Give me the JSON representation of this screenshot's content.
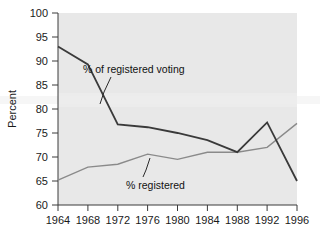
{
  "chart_data": {
    "type": "line",
    "title": "",
    "xlabel": "",
    "ylabel": "Percent",
    "x": [
      1964,
      1968,
      1972,
      1976,
      1980,
      1984,
      1988,
      1992,
      1996
    ],
    "xlim": [
      1964,
      1996
    ],
    "ylim": [
      60,
      100
    ],
    "xticks": [
      1964,
      1968,
      1972,
      1976,
      1980,
      1984,
      1988,
      1992,
      1996
    ],
    "yticks": [
      60,
      65,
      70,
      75,
      80,
      85,
      90,
      95,
      100
    ],
    "grid": false,
    "legend": "inline-annotations",
    "series": [
      {
        "name": "% of registered voting",
        "color": "#3a3a3a",
        "values": [
          93.0,
          89.3,
          76.8,
          76.2,
          75.0,
          73.5,
          71.0,
          77.2,
          65.0
        ]
      },
      {
        "name": "% registered",
        "color": "#8a8a8a",
        "values": [
          65.2,
          67.9,
          68.5,
          70.6,
          69.5,
          71.0,
          71.0,
          72.0,
          77.0
        ]
      }
    ],
    "annotations": [
      {
        "text": "% of registered voting",
        "series": "% of registered voting"
      },
      {
        "text": "% registered",
        "series": "% registered"
      }
    ]
  },
  "axes": {
    "y_title": "Percent",
    "y_tick_labels": [
      "100",
      "95",
      "90",
      "85",
      "80",
      "75",
      "70",
      "65",
      "60"
    ],
    "x_tick_labels": [
      "1964",
      "1968",
      "1972",
      "1976",
      "1980",
      "1984",
      "1988",
      "1992",
      "1996"
    ]
  },
  "annotations": {
    "voting_label": "% of registered voting",
    "registered_label": "% registered"
  },
  "colors": {
    "plot_background": "#e8e8e8",
    "page_background": "#ffffff",
    "voting_line": "#3a3a3a",
    "registered_line": "#8a8a8a",
    "axis": "#3a3a3a",
    "text": "#1a1a1a"
  }
}
